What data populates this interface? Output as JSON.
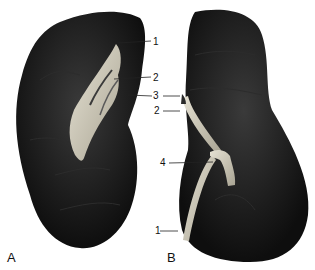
{
  "figure": {
    "panels": [
      {
        "id": "A",
        "label": "A"
      },
      {
        "id": "B",
        "label": "B"
      }
    ],
    "labels_a": [
      {
        "text": "1"
      },
      {
        "text": "2"
      },
      {
        "text": "3"
      }
    ],
    "labels_b": [
      {
        "text": "2"
      },
      {
        "text": "4"
      },
      {
        "text": "1"
      }
    ],
    "colors": {
      "organ": "#1a1a1a",
      "vessel": "#cfcab8",
      "background": "#ffffff"
    }
  }
}
